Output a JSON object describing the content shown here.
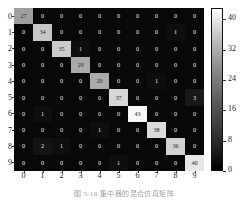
{
  "figure": {
    "caption": "图 5-16  集中器的混合仿真矩阵",
    "background_color": "#ffffff",
    "matrix_background": "#0b0b0b"
  },
  "chart_data": {
    "type": "heatmap",
    "title": "",
    "xlabel": "",
    "ylabel": "",
    "categories_x": [
      "0",
      "1",
      "2",
      "3",
      "4",
      "5",
      "6",
      "7",
      "8",
      "9"
    ],
    "categories_y": [
      "0",
      "1",
      "2",
      "3",
      "4",
      "5",
      "6",
      "7",
      "8",
      "9"
    ],
    "colormap": "gray",
    "vmin": 0,
    "vmax": 43,
    "grid": false,
    "values": [
      [
        27,
        0,
        0,
        0,
        0,
        0,
        0,
        0,
        0,
        0
      ],
      [
        0,
        34,
        0,
        0,
        0,
        0,
        0,
        0,
        1,
        0
      ],
      [
        0,
        0,
        35,
        1,
        0,
        0,
        0,
        0,
        0,
        0
      ],
      [
        0,
        0,
        0,
        29,
        0,
        0,
        0,
        0,
        0,
        0
      ],
      [
        0,
        0,
        0,
        0,
        29,
        0,
        0,
        1,
        0,
        0
      ],
      [
        0,
        0,
        0,
        0,
        0,
        37,
        0,
        0,
        0,
        3
      ],
      [
        0,
        1,
        0,
        0,
        0,
        0,
        43,
        0,
        0,
        0
      ],
      [
        0,
        0,
        0,
        0,
        1,
        0,
        0,
        38,
        0,
        0
      ],
      [
        0,
        2,
        1,
        0,
        0,
        0,
        0,
        0,
        36,
        0
      ],
      [
        0,
        0,
        0,
        0,
        0,
        1,
        0,
        0,
        0,
        40
      ]
    ]
  },
  "colorbar": {
    "ticks": [
      0,
      8,
      16,
      24,
      32,
      40
    ],
    "labels": [
      "0",
      "8",
      "16",
      "24",
      "32",
      "40"
    ],
    "min": 0,
    "max": 43,
    "orientation": "vertical",
    "position": "right"
  }
}
